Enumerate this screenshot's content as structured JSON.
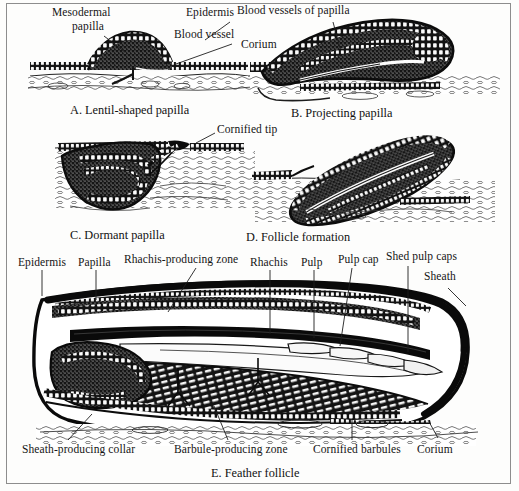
{
  "figure": {
    "title_visible": false,
    "style": "engraved histological line drawing plate",
    "frame_color": "#8d8d8d",
    "background_color": "#fdfdfc",
    "ink_color": "#111111"
  },
  "panels": [
    {
      "id": "A",
      "caption": "A. Lentil-shaped papilla",
      "labels": [
        {
          "text": "Mesodermal",
          "x": 52,
          "y": 8
        },
        {
          "text": "papilla",
          "x": 72,
          "y": 22
        },
        {
          "text": "Epidermis",
          "x": 188,
          "y": 8
        },
        {
          "text": "Blood vessel",
          "x": 176,
          "y": 30
        }
      ]
    },
    {
      "id": "B",
      "caption": "B. Projecting papilla",
      "labels": [
        {
          "text": "Blood vessels of papilla",
          "x": 239,
          "y": 6
        },
        {
          "text": "Corium",
          "x": 243,
          "y": 40
        }
      ]
    },
    {
      "id": "C",
      "caption": "C. Dormant papilla",
      "labels": [
        {
          "text": "Cornified tip",
          "x": 218,
          "y": 125
        }
      ]
    },
    {
      "id": "D",
      "caption": "D. Follicle formation",
      "labels": []
    },
    {
      "id": "E",
      "caption": "E. Feather follicle",
      "labels": [
        {
          "text": "Epidermis",
          "x": 22,
          "y": 259
        },
        {
          "text": "Papilla",
          "x": 83,
          "y": 259
        },
        {
          "text": "Rhachis-producing zone",
          "x": 127,
          "y": 255
        },
        {
          "text": "Rhachis",
          "x": 252,
          "y": 259
        },
        {
          "text": "Pulp",
          "x": 303,
          "y": 259
        },
        {
          "text": "Pulp cap",
          "x": 341,
          "y": 256
        },
        {
          "text": "Shed pulp caps",
          "x": 390,
          "y": 253
        },
        {
          "text": "Sheath",
          "x": 427,
          "y": 272
        },
        {
          "text": "Sheath-producing collar",
          "x": 22,
          "y": 445
        },
        {
          "text": "Barbule-producing zone",
          "x": 175,
          "y": 445
        },
        {
          "text": "Cornified barbules",
          "x": 315,
          "y": 445
        },
        {
          "text": "Corium",
          "x": 419,
          "y": 445
        }
      ]
    }
  ],
  "captions": [
    {
      "id": "A",
      "text": "A. Lentil-shaped papilla",
      "x": 70,
      "y": 105
    },
    {
      "id": "B",
      "text": "B. Projecting papilla",
      "x": 293,
      "y": 108
    },
    {
      "id": "C",
      "text": "C. Dormant papilla",
      "x": 70,
      "y": 230
    },
    {
      "id": "D",
      "text": "D. Follicle formation",
      "x": 247,
      "y": 232
    },
    {
      "id": "E",
      "text": "E. Feather follicle",
      "x": 212,
      "y": 468
    }
  ]
}
